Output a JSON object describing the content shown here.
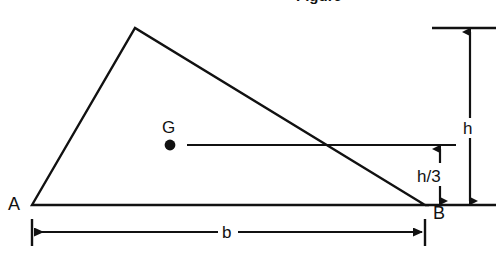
{
  "figure": {
    "kind": "geometry-diagram",
    "title_fragment": "Figure",
    "background_color": "#ffffff",
    "stroke_color": "#111111",
    "labels": {
      "vertex_a": "A",
      "vertex_b": "B",
      "centroid": "G",
      "base": "b",
      "height": "h",
      "centroid_height": "h/3"
    },
    "geometry": {
      "vertex_a": [
        32,
        205
      ],
      "vertex_b": [
        425,
        205
      ],
      "apex": [
        135,
        28
      ],
      "centroid_point": [
        170,
        145
      ],
      "baseline_y": 205,
      "centroid_line_y": 145,
      "top_line_y": 28,
      "base_dimension_y": 232,
      "h_arrow_x": 470,
      "h3_arrow_x": 440
    },
    "annotations": {
      "centroid_line_from_x": 187,
      "centroid_line_to_x": 456,
      "base_dim_from_x": 32,
      "base_dim_to_x": 425
    }
  }
}
